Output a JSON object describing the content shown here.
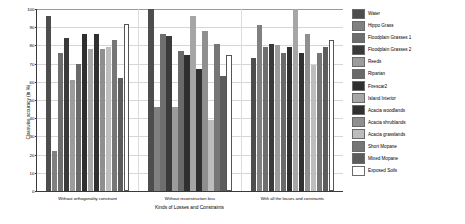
{
  "chart_data": {
    "type": "bar",
    "title": "",
    "xlabel": "Kinds of Losses and Constraints",
    "ylabel": "Classwise accuracy (in %)",
    "ylim": [
      0,
      100
    ],
    "yticks": [
      0,
      10,
      20,
      30,
      40,
      50,
      60,
      70,
      80,
      90,
      100
    ],
    "grid": true,
    "legend_position": "right",
    "categories": [
      "Without orthogonality constraint",
      "Without reconstruction loss",
      "With all the losses and constraints"
    ],
    "series": [
      {
        "name": "Water",
        "color": "#4d4d4d",
        "values": [
          96,
          100,
          73
        ]
      },
      {
        "name": "Hippo Grass",
        "color": "#808080",
        "values": [
          22,
          46,
          91
        ]
      },
      {
        "name": "Floodplain Grasses 1",
        "color": "#6e6e6e",
        "values": [
          76,
          86,
          79
        ]
      },
      {
        "name": "Floodplain Grasses 2",
        "color": "#3a3a3a",
        "values": [
          84,
          85,
          81
        ]
      },
      {
        "name": "Reeds",
        "color": "#9c9c9c",
        "values": [
          61,
          46,
          80
        ]
      },
      {
        "name": "Riparian",
        "color": "#6a6a6a",
        "values": [
          70,
          77,
          76
        ]
      },
      {
        "name": "Firescar2",
        "color": "#2f2f2f",
        "values": [
          86,
          75,
          79
        ]
      },
      {
        "name": "Island Interior",
        "color": "#a6a6a6",
        "values": [
          78,
          96,
          100
        ]
      },
      {
        "name": "Acacia woodlands",
        "color": "#303030",
        "values": [
          86,
          67,
          76
        ]
      },
      {
        "name": "Acacia shrublands",
        "color": "#8f8f8f",
        "values": [
          78,
          88,
          86
        ]
      },
      {
        "name": "Acacia grasslands",
        "color": "#bdbdbd",
        "values": [
          79,
          39,
          69
        ]
      },
      {
        "name": "Short Mopane",
        "color": "#767676",
        "values": [
          83,
          81,
          76
        ]
      },
      {
        "name": "Mixed Mopane",
        "color": "#5c5c5c",
        "values": [
          62,
          63,
          79
        ]
      },
      {
        "name": "Exposed Soils",
        "color": "#ffffff",
        "values": [
          92,
          75,
          83
        ]
      }
    ]
  }
}
